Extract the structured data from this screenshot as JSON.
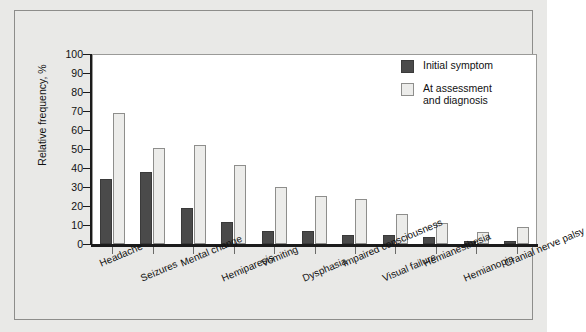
{
  "chart_data": {
    "type": "bar",
    "title": "",
    "xlabel": "",
    "ylabel": "Relative frequency, %",
    "ylim": [
      0,
      100
    ],
    "ytick_values": [
      0,
      10,
      20,
      30,
      40,
      50,
      60,
      70,
      80,
      90,
      100
    ],
    "ytick_labels": [
      "0",
      "10",
      "20",
      "30",
      "40",
      "50",
      "60",
      "70",
      "80",
      "90",
      "100"
    ],
    "grid": false,
    "legend_position": "top-right",
    "categories": [
      "Headache",
      "Seizures",
      "Mental change",
      "Hemiparesis",
      "Vomiting",
      "Dysphasia",
      "Impaired consciousness",
      "Visual failure",
      "Hemianesthesia",
      "Hemianopia",
      "Cranial nerve palsy"
    ],
    "series": [
      {
        "name": "Initial symptom",
        "color": "#4a4a4a",
        "values": [
          34,
          38,
          19,
          11.5,
          7,
          7,
          5,
          4.5,
          3.5,
          1.5,
          1.5
        ]
      },
      {
        "name": "At assessment and diagnosis",
        "color": "#ececea",
        "values": [
          69,
          50.5,
          52,
          41.5,
          30,
          25.5,
          23.5,
          16,
          11,
          6.5,
          9
        ]
      }
    ]
  },
  "legend": {
    "items": [
      {
        "label": "Initial symptom",
        "swatch": "initial"
      },
      {
        "label": "At assessment and diagnosis",
        "swatch": "assess"
      }
    ],
    "item_0_label": "Initial symptom",
    "item_1_line_1": "At assessment",
    "item_1_line_2": "and diagnosis"
  },
  "colors": {
    "figure_background": "#e9e9e7",
    "plot_background": "#ffffff",
    "axis": "#1b1b1b",
    "initial_symptom": "#4a4a4a",
    "at_assessment": "#ececea",
    "frame_border": "#8d8d8b"
  }
}
